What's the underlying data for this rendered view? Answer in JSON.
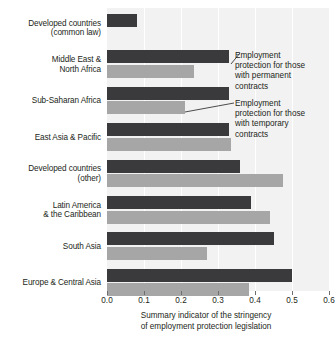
{
  "chart_data": {
    "type": "bar",
    "orientation": "horizontal",
    "title": "",
    "xlabel": "Summary indicator of the stringency of employment protection legislation",
    "ylabel": "",
    "xlim": [
      0.0,
      0.6
    ],
    "xticks": [
      "0.0",
      "0.1",
      "0.2",
      "0.3",
      "0.4",
      "0.5",
      "0.6"
    ],
    "xtick_values": [
      0.0,
      0.1,
      0.2,
      0.3,
      0.4,
      0.5,
      0.6
    ],
    "grid": true,
    "legend_position": "annotation-callouts",
    "categories": [
      "Developed countries\n(common law)",
      "Middle East &\nNorth Africa",
      "Sub-Saharan Africa",
      "East Asia & Pacific",
      "Developed countries\n(other)",
      "Latin America\n& the Caribbean",
      "South Asia",
      "Europe & Central Asia"
    ],
    "series": [
      {
        "name": "Employment protection for those with permanent contracts",
        "color": "#3a3a3c",
        "values": [
          0.08,
          0.33,
          0.33,
          0.33,
          0.36,
          0.39,
          0.45,
          0.5
        ]
      },
      {
        "name": "Employment protection for those with temporary contracts",
        "color": "#a6a6a6",
        "values": [
          0.0,
          0.235,
          0.21,
          0.335,
          0.475,
          0.44,
          0.27,
          0.385
        ]
      }
    ],
    "annotations": [
      {
        "id": "permanent",
        "text": "Employment\nprotection for those\nwith permanent\ncontracts"
      },
      {
        "id": "temporary",
        "text": "Employment\nprotection for those\nwith temporary\ncontracts"
      }
    ]
  },
  "axis": {
    "x_title_line1": "Summary indicator of the stringency",
    "x_title_line2": "of employment protection legislation"
  },
  "colors": {
    "permanent_bar": "#3a3a3c",
    "temporary_bar": "#a6a6a6",
    "plot_background": "#f2f2f2",
    "gridline": "#ffffff",
    "text": "#231f20"
  }
}
